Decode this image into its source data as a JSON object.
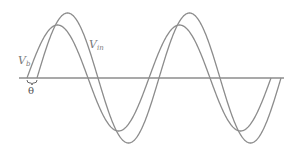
{
  "diagram": {
    "labels": {
      "vb_main": "V",
      "vb_sub": "b",
      "vin_main": "V",
      "vin_sub": "in",
      "phase_angle": "θ"
    },
    "colors": {
      "axis": "#555555",
      "curve": "#8c8c8c",
      "label": "#7a7a7a"
    },
    "curves": [
      {
        "name": "V_b",
        "zero_crossing_x": 27,
        "amplitude_px": 53,
        "period_px": 122
      },
      {
        "name": "V_in",
        "zero_crossing_x": 37,
        "amplitude_px": 65,
        "period_px": 122
      }
    ],
    "axis_y": 78
  }
}
